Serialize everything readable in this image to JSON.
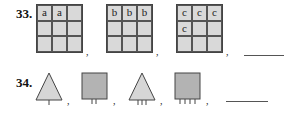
{
  "problems": [
    {
      "number": "33.",
      "grids": [
        {
          "cells": [
            "a",
            "a",
            "",
            "",
            "",
            "",
            "",
            "",
            ""
          ]
        },
        {
          "cells": [
            "b",
            "b",
            "b",
            "",
            "",
            "",
            "",
            "",
            ""
          ]
        },
        {
          "cells": [
            "c",
            "c",
            "c",
            "c",
            "",
            "",
            "",
            "",
            ""
          ]
        }
      ],
      "separator": ",",
      "answer_blank": ""
    },
    {
      "number": "34.",
      "shapes": [
        {
          "type": "triangle",
          "ticks": 1
        },
        {
          "type": "square",
          "ticks": 2
        },
        {
          "type": "triangle",
          "ticks": 3
        },
        {
          "type": "square",
          "ticks": 4
        }
      ],
      "separator": ",",
      "answer_blank": ""
    }
  ],
  "colors": {
    "grid_fill": "#d9d9d9",
    "triangle_fill": "#d6d6d6",
    "square_fill": "#b3b3b3",
    "stroke": "#444444"
  }
}
